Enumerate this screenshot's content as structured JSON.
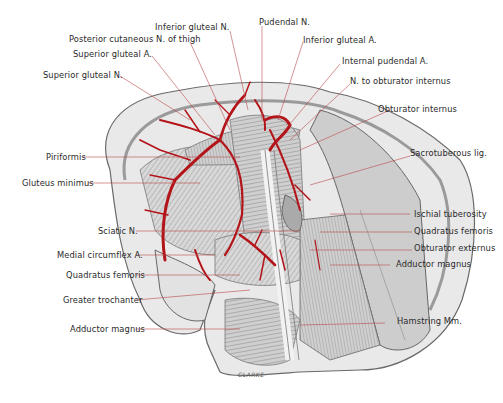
{
  "figure": {
    "signature": "CLARKE",
    "colors": {
      "artery": "#b3141a",
      "leader_line": "#b84a4a",
      "muscle": "#c9c9c9",
      "bone": "#e6e6e6",
      "outline": "#555555"
    }
  },
  "labels": {
    "inferior_gluteal_n": "Inferior gluteal N.",
    "pudendal_n": "Pudendal N.",
    "posterior_cutaneous_n": "Posterior cutaneous N. of thigh",
    "inferior_gluteal_a": "Inferior gluteal A.",
    "superior_gluteal_a": "Superior gluteal A.",
    "internal_pudendal_a": "Internal pudendal A.",
    "superior_gluteal_n": "Superior gluteal N.",
    "n_obturator_internus": "N. to obturator internus",
    "obturator_internus": "Obturator internus",
    "piriformis": "Piriformis",
    "sacrotuberous_lig": "Sacrotuberous lig.",
    "gluteus_minimus": "Gluteus minimus",
    "ischial_tuberosity": "Ischial tuberosity",
    "sciatic_n": "Sciatic N.",
    "quadratus_femoris_right": "Quadratus femoris",
    "medial_circumflex_a": "Medial circumflex A.",
    "obturator_externus": "Obturator externus",
    "quadratus_femoris_left": "Quadratus femoris",
    "adductor_magnus_right": "Adductor magnus",
    "greater_trochanter": "Greater trochanter",
    "hamstring_mm": "Hamstring Mm.",
    "adductor_magnus_left": "Adductor magnus"
  }
}
